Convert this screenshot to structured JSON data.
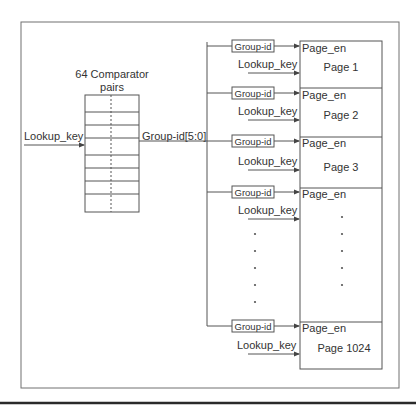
{
  "figure": {
    "comparator": {
      "title_line1": "64 Comparator",
      "title_line2": "pairs",
      "rows": 8
    },
    "input_label": "Lookup_key",
    "bus_label": "Group-id[5:0]",
    "pages": [
      {
        "group_id_label": "Group-id",
        "enable_label": "Page_en",
        "key_label": "Lookup_key",
        "name": "Page 1"
      },
      {
        "group_id_label": "Group-id",
        "enable_label": "Page_en",
        "key_label": "Lookup_key",
        "name": "Page 2"
      },
      {
        "group_id_label": "Group-id",
        "enable_label": "Page_en",
        "key_label": "Lookup_key",
        "name": "Page 3"
      },
      {
        "group_id_label": "Group-id",
        "enable_label": "Page_en",
        "key_label": "Lookup_key",
        "name": ""
      },
      {
        "group_id_label": "Group-id",
        "enable_label": "Page_en",
        "key_label": "Lookup_key",
        "name": "Page 1024"
      }
    ],
    "ellipsis_dot_count": 5,
    "colors": {
      "line": "#555555",
      "frame": "#707070",
      "text": "#333333",
      "bottom_rule": "#2a2a2a"
    }
  }
}
